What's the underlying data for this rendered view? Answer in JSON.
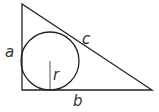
{
  "diagram": {
    "colors": {
      "stroke": "#222222",
      "label": "#333333",
      "background": "#ffffff"
    },
    "triangle": {
      "vertices": {
        "top": [
          22,
          4
        ],
        "right_angle": [
          22,
          90
        ],
        "bottom_right": [
          152,
          90
        ]
      }
    },
    "incircle": {
      "center": [
        50,
        61
      ],
      "radius": 29
    },
    "radius_segment": {
      "from": [
        50,
        61
      ],
      "to": [
        50,
        90
      ]
    },
    "labels": {
      "a": {
        "text": "a",
        "x": 5,
        "y": 57
      },
      "b": {
        "text": "b",
        "x": 73,
        "y": 106
      },
      "c": {
        "text": "c",
        "x": 82,
        "y": 44
      },
      "r": {
        "text": "r",
        "x": 53,
        "y": 80
      }
    }
  }
}
